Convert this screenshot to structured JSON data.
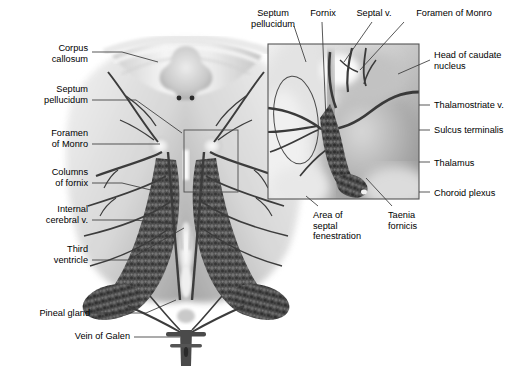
{
  "figure": {
    "view": "superior (top-down) view of the ventricular system, with magnified inset of the right foramen of Monro region",
    "style": "grayscale medical illustration, airbrush shading, black leader lines",
    "background_color": "#ffffff",
    "text_color": "#000000",
    "leader_color": "#3a3a3a",
    "inset_border_color": "#555555"
  },
  "labels_left": [
    {
      "id": "corpus-callosum",
      "text": "Corpus\ncallosum",
      "x": 18,
      "y": 43,
      "w": 70,
      "anchor_x": 122,
      "anchor_y": 58
    },
    {
      "id": "septum-pellucidum",
      "text": "Septum\npellucidum",
      "x": 8,
      "y": 84,
      "w": 80,
      "anchor_x": 182,
      "anchor_y": 133
    },
    {
      "id": "foramen-of-monro",
      "text": "Foramen\nof Monro",
      "x": 12,
      "y": 128,
      "w": 76,
      "anchor_x": 160,
      "anchor_y": 145
    },
    {
      "id": "columns-of-fornix",
      "text": "Columns\nof fornix",
      "x": 12,
      "y": 167,
      "w": 76,
      "anchor_x": 151,
      "anchor_y": 186
    },
    {
      "id": "internal-cerebral-vein",
      "text": "Internal\ncerebral v.",
      "x": 8,
      "y": 204,
      "w": 80,
      "anchor_x": 176,
      "anchor_y": 222
    },
    {
      "id": "third-ventricle",
      "text": "Third\nventricle",
      "x": 20,
      "y": 244,
      "w": 68,
      "anchor_x": 183,
      "anchor_y": 232
    },
    {
      "id": "pineal-gland",
      "text": "Pineal gland",
      "x": 14,
      "y": 308,
      "w": 76,
      "anchor_x": 180,
      "anchor_y": 288
    },
    {
      "id": "vein-of-galen",
      "text": "Vein of Galen",
      "x": 52,
      "y": 331,
      "w": 78,
      "anchor_x": 183,
      "anchor_y": 340
    }
  ],
  "labels_top": [
    {
      "id": "septum-pellucidum-inset",
      "text": "Septum\npellucidum",
      "x": 244,
      "y": 8,
      "w": 58,
      "anchor_x": 305,
      "anchor_y": 66
    },
    {
      "id": "fornix",
      "text": "Fornix",
      "x": 304,
      "y": 8,
      "w": 38,
      "anchor_x": 325,
      "anchor_y": 122
    },
    {
      "id": "septal-vein",
      "text": "Septal v.",
      "x": 352,
      "y": 8,
      "w": 44,
      "anchor_x": 345,
      "anchor_y": 60
    },
    {
      "id": "foramen-of-monro-inset",
      "text": "Foramen of Monro",
      "x": 406,
      "y": 8,
      "w": 96,
      "anchor_x": 358,
      "anchor_y": 68
    }
  ],
  "labels_right": [
    {
      "id": "head-of-caudate-nucleus",
      "text": "Head of caudate\nnucleus",
      "x": 434,
      "y": 50,
      "anchor_x": 398,
      "anchor_y": 72
    },
    {
      "id": "thalamostriate-vein",
      "text": "Thalamostriate v.",
      "x": 434,
      "y": 100,
      "anchor_x": 418,
      "anchor_y": 107
    },
    {
      "id": "sulcus-terminalis",
      "text": "Sulcus terminalis",
      "x": 434,
      "y": 125,
      "anchor_x": 418,
      "anchor_y": 130
    },
    {
      "id": "thalamus",
      "text": "Thalamus",
      "x": 434,
      "y": 158,
      "anchor_x": 418,
      "anchor_y": 162
    },
    {
      "id": "choroid-plexus",
      "text": "Choroid plexus",
      "x": 434,
      "y": 188,
      "anchor_x": 418,
      "anchor_y": 192
    }
  ],
  "labels_bottom": [
    {
      "id": "area-of-septal-fenestration",
      "text": "Area of\nseptal\nfenestration",
      "x": 313,
      "y": 210,
      "w": 62,
      "anchor_x": 306,
      "anchor_y": 196
    },
    {
      "id": "taenia-fornicis",
      "text": "Taenia\nfornicis",
      "x": 388,
      "y": 210,
      "w": 48,
      "anchor_x": 365,
      "anchor_y": 178
    }
  ],
  "inset_panel": {
    "x": 268,
    "y": 44,
    "width": 151,
    "height": 155,
    "description": "magnified view of foramen of Monro, thalamostriate vein, taenia fornicis and choroid plexus"
  },
  "detail_box_main": {
    "x": 184,
    "y": 130,
    "width": 54,
    "height": 62,
    "description": "outline in main figure marking the region shown enlarged in the inset"
  }
}
